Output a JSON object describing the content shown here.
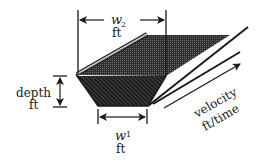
{
  "diagram": {
    "labels": {
      "top_width_var": "w",
      "top_width_sub": "2",
      "top_width_unit": "ft",
      "bottom_width_var": "w",
      "bottom_width_sub": "1",
      "bottom_width_unit": "ft",
      "depth": "depth",
      "depth_unit": "ft",
      "velocity": "velocity",
      "velocity_unit": "ft/time"
    },
    "colors": {
      "ink": "#1a1a1a",
      "water_top": "#3a3a3a",
      "water_section": "#2a2a2a",
      "bank_strip": "#bdbdbd"
    }
  }
}
